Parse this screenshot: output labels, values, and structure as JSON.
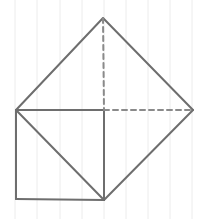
{
  "diagram": {
    "type": "geometry-sketch",
    "background": "#ffffff",
    "grid": {
      "orientation": "vertical",
      "color": "#ececec",
      "x_positions": [
        15,
        37,
        60,
        82,
        104,
        126,
        148,
        170,
        192
      ]
    },
    "stroke_color": "#6e6e6e",
    "dash_color": "#8a8a8a",
    "points": {
      "top": [
        103,
        18
      ],
      "left": [
        16,
        110
      ],
      "right": [
        193,
        110
      ],
      "mid": [
        104,
        110
      ],
      "bottom_left": [
        16,
        199
      ],
      "bottom_right": [
        104,
        200
      ]
    },
    "solid_segments": [
      [
        "left",
        "top"
      ],
      [
        "top",
        "right"
      ],
      [
        "right",
        "bottom_right"
      ],
      [
        "left",
        "mid"
      ],
      [
        "mid",
        "bottom_right"
      ],
      [
        "left",
        "bottom_left"
      ],
      [
        "bottom_left",
        "bottom_right"
      ],
      [
        "left",
        "bottom_right"
      ]
    ],
    "dashed_segments": [
      [
        "top",
        "mid"
      ],
      [
        "mid",
        "right"
      ]
    ]
  }
}
